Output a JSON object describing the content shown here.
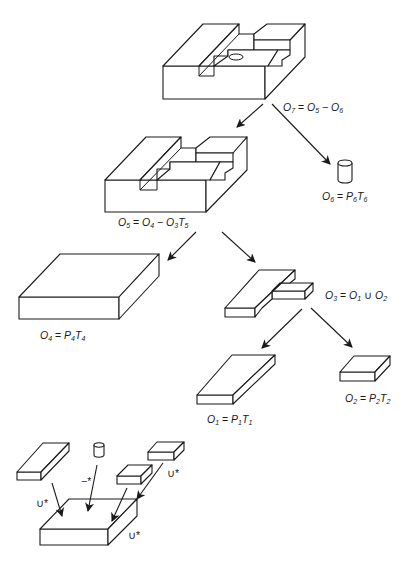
{
  "figure": {
    "nodes": [
      {
        "id": "O7",
        "label": "O",
        "sub": "7",
        "expr": [
          " = ",
          "O",
          "5",
          " − ",
          "O",
          "6",
          ""
        ]
      },
      {
        "id": "O6",
        "label": "O",
        "sub": "6",
        "expr": [
          " = ",
          "P",
          "6",
          "",
          "T",
          "6",
          ""
        ]
      },
      {
        "id": "O5",
        "label": "O",
        "sub": "5",
        "expr": [
          " = ",
          "O",
          "4",
          " − ",
          "O",
          "3",
          "T",
          "5"
        ]
      },
      {
        "id": "O4",
        "label": "O",
        "sub": "4",
        "expr": [
          " = ",
          "P",
          "4",
          "",
          "T",
          "4",
          ""
        ]
      },
      {
        "id": "O3",
        "label": "O",
        "sub": "3",
        "expr": [
          " = ",
          "O",
          "1",
          " ∪ ",
          "O",
          "2",
          ""
        ]
      },
      {
        "id": "O1",
        "label": "O",
        "sub": "1",
        "expr": [
          " = ",
          "P",
          "1",
          "",
          "T",
          "1",
          ""
        ]
      },
      {
        "id": "O2",
        "label": "O",
        "sub": "2",
        "expr": [
          " = ",
          "P",
          "2",
          "",
          "T",
          "2",
          ""
        ]
      }
    ],
    "labels": {
      "o7": "O₇ = O₅ − O₆",
      "o6": "O₆ = P₆T₆",
      "o5": "O₅ = O₄ − O₃T₅",
      "o4": "O₄ = P₄T₄",
      "o3": "O₃ = O₁ ∪ O₂",
      "o1": "O₁ = P₁T₁",
      "o2": "O₂ = P₂T₂"
    },
    "operators": {
      "union_left": "∪*",
      "difference": "−*",
      "union_right_top": "∪*",
      "union_right_bottom": "∪*"
    },
    "edges": [
      {
        "from": "O7",
        "to": "O5"
      },
      {
        "from": "O7",
        "to": "O6"
      },
      {
        "from": "O5",
        "to": "O4"
      },
      {
        "from": "O5",
        "to": "O3"
      },
      {
        "from": "O3",
        "to": "O1"
      },
      {
        "from": "O3",
        "to": "O2"
      }
    ],
    "colors": {
      "ink": "#1a1a1a",
      "background": "#ffffff"
    }
  }
}
